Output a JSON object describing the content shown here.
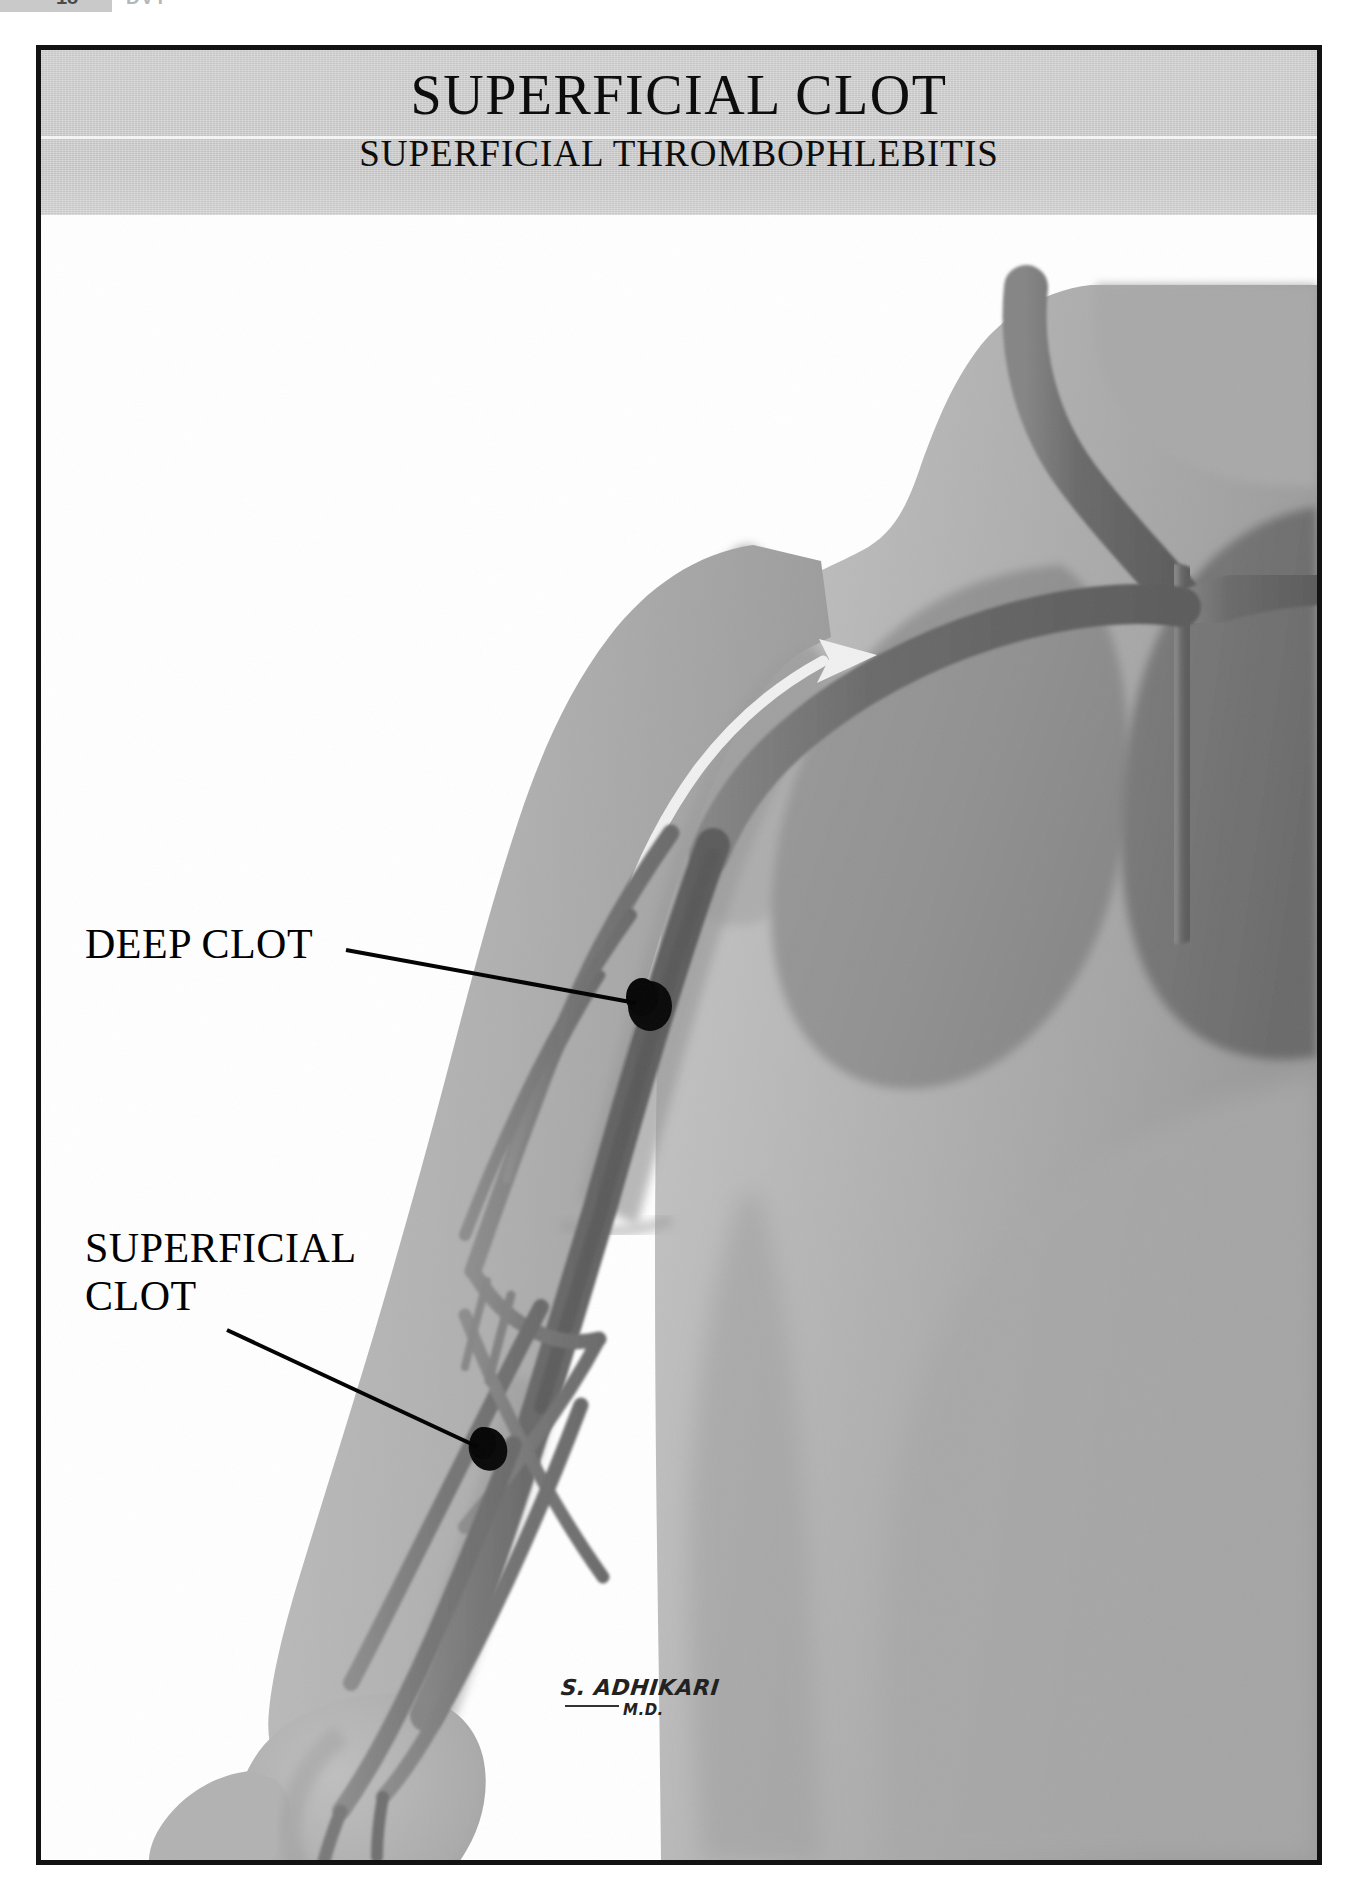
{
  "page_header": {
    "page_number": "18",
    "section_word": "DVT"
  },
  "plate": {
    "title": "SUPERFICIAL CLOT",
    "subtitle": "SUPERFICIAL THROMBOPHLEBITIS",
    "border_color": "#121212",
    "banner_color": "#cfcfcf"
  },
  "labels": {
    "deep_clot": "DEEP CLOT",
    "superficial_clot_line1": "SUPERFICIAL",
    "superficial_clot_line2": "CLOT"
  },
  "signature": {
    "name": "S. ADHIKARI",
    "credential": "M.D."
  },
  "illustration": {
    "icons": {
      "flow_arrow": "blood-flow-arrow-icon",
      "deep_clot_marker": "deep-clot-marker-icon",
      "superficial_clot_marker": "superficial-clot-marker-icon"
    },
    "colors": {
      "skin_light": "#b4b4b4",
      "skin_mid": "#a3a3a3",
      "muscle_shadow": "#8f8f8f",
      "deep_shadow": "#6f6f6f",
      "vein": "#6e6e6e",
      "vein_dark": "#5a5a5a",
      "clot": "#0a0a0a",
      "arrow": "#f2f2f2",
      "background": "#ffffff"
    },
    "parts": {
      "torso": "torso-silhouette",
      "arm": "right-arm-silhouette",
      "hand": "open-hand",
      "pectoral": "pectoral-muscle-shadow",
      "deep_vein": "deep-brachial-vein",
      "superficial_veins": "superficial-vein-network",
      "subclavian": "subclavian-vein",
      "jugular": "internal-jugular-vein",
      "svc": "superior-vena-cava"
    }
  }
}
